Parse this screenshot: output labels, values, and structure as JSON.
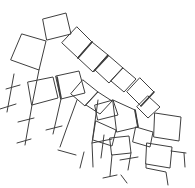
{
  "figure": {
    "kind": "freehand-line-sketch",
    "canvas": {
      "width": 195,
      "height": 188
    },
    "background_color": "#ffffff",
    "stroke_color": "#3f3f3f",
    "stroke_width": 1,
    "emphasis_width": 1.7,
    "quads": [
      [
        [
          43,
          19
        ],
        [
          66,
          13
        ],
        [
          71,
          34
        ],
        [
          47,
          40
        ]
      ],
      [
        [
          22,
          34
        ],
        [
          46,
          41
        ],
        [
          39,
          70
        ],
        [
          11,
          60
        ]
      ],
      [
        [
          77,
          27
        ],
        [
          92,
          42
        ],
        [
          78,
          58
        ],
        [
          62,
          43
        ]
      ],
      [
        [
          92,
          42
        ],
        [
          108,
          55
        ],
        [
          93,
          72
        ],
        [
          78,
          58
        ]
      ],
      [
        [
          108,
          55
        ],
        [
          123,
          68
        ],
        [
          109,
          83
        ],
        [
          95,
          70
        ]
      ],
      [
        [
          123,
          68
        ],
        [
          136,
          79
        ],
        [
          124,
          92
        ],
        [
          111,
          81
        ]
      ],
      [
        [
          140,
          78
        ],
        [
          154,
          92
        ],
        [
          141,
          106
        ],
        [
          127,
          92
        ]
      ],
      [
        [
          148,
          96
        ],
        [
          160,
          107
        ],
        [
          148,
          118
        ],
        [
          137,
          107
        ]
      ],
      [
        [
          155,
          113
        ],
        [
          181,
          117
        ],
        [
          179,
          141
        ],
        [
          154,
          137
        ]
      ],
      [
        [
          147,
          143
        ],
        [
          172,
          147
        ],
        [
          170,
          168
        ],
        [
          146,
          164
        ]
      ],
      [
        [
          28,
          82
        ],
        [
          53,
          77
        ],
        [
          58,
          98
        ],
        [
          32,
          105
        ]
      ],
      [
        [
          56,
          76
        ],
        [
          79,
          71
        ],
        [
          85,
          93
        ],
        [
          61,
          99
        ]
      ],
      [
        [
          83,
          80
        ],
        [
          98,
          92
        ],
        [
          85,
          106
        ],
        [
          71,
          94
        ]
      ],
      [
        [
          98,
          92
        ],
        [
          112,
          101
        ],
        [
          100,
          114
        ],
        [
          86,
          105
        ]
      ],
      [
        [
          95,
          105
        ],
        [
          113,
          100
        ],
        [
          118,
          115
        ],
        [
          98,
          120
        ]
      ],
      [
        [
          113,
          100
        ],
        [
          135,
          110
        ],
        [
          138,
          127
        ],
        [
          117,
          132
        ]
      ],
      [
        [
          96,
          121
        ],
        [
          116,
          130
        ],
        [
          112,
          146
        ],
        [
          93,
          140
        ]
      ],
      [
        [
          136,
          127
        ],
        [
          153,
          132
        ],
        [
          150,
          147
        ],
        [
          133,
          142
        ]
      ],
      [
        [
          110,
          138
        ],
        [
          129,
          136
        ],
        [
          131,
          153
        ],
        [
          112,
          155
        ]
      ]
    ],
    "stems": [
      [
        [
          14,
          74
        ],
        [
          7,
          112
        ]
      ],
      [
        [
          39,
          70
        ],
        [
          32,
          105
        ],
        [
          25,
          145
        ]
      ],
      [
        [
          61,
          99
        ],
        [
          53,
          134
        ]
      ],
      [
        [
          77,
          100
        ],
        [
          66,
          130
        ],
        [
          60,
          147
        ]
      ],
      [
        [
          98,
          100
        ],
        [
          92,
          143
        ],
        [
          93,
          167
        ]
      ],
      [
        [
          104,
          135
        ],
        [
          101,
          158
        ]
      ],
      [
        [
          112,
          155
        ],
        [
          110,
          176
        ]
      ],
      [
        [
          131,
          153
        ],
        [
          128,
          170
        ]
      ],
      [
        [
          146,
          164
        ],
        [
          146,
          168
        ],
        [
          166,
          172
        ],
        [
          168,
          185
        ]
      ],
      [
        [
          184,
          153
        ],
        [
          185,
          167
        ]
      ]
    ],
    "ticks": [
      [
        0,
        109,
        16,
        104
      ],
      [
        6,
        89,
        20,
        85
      ],
      [
        18,
        122,
        34,
        118
      ],
      [
        17,
        143,
        31,
        139
      ],
      [
        46,
        130,
        62,
        126
      ],
      [
        58,
        150,
        76,
        155
      ],
      [
        92,
        143,
        112,
        139
      ],
      [
        103,
        178,
        117,
        175
      ],
      [
        84,
        152,
        80,
        168
      ],
      [
        120,
        160,
        138,
        157
      ],
      [
        171,
        151,
        186,
        153
      ],
      [
        121,
        175,
        127,
        183
      ]
    ],
    "emphasis_strokes": [
      [
        92,
        42,
        78,
        58
      ],
      [
        108,
        56,
        94,
        71
      ],
      [
        154,
        92,
        141,
        106
      ],
      [
        135,
        110,
        138,
        127
      ],
      [
        57,
        77,
        61,
        98
      ]
    ]
  }
}
